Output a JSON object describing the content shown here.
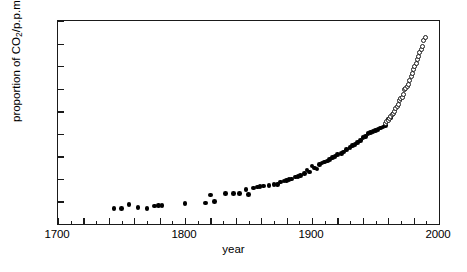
{
  "chart_data": {
    "type": "scatter",
    "title": "",
    "xlabel": "year",
    "ylabel": "proportion of CO2/p.p.m.",
    "ylabel_html": "proportion of CO<sub>2</sub>/p.p.m.",
    "xlim": [
      1700,
      2000
    ],
    "ylim": [
      270,
      360
    ],
    "xticks": [
      1700,
      1800,
      1900,
      2000
    ],
    "xtick_labels": [
      "1700",
      "1800",
      "1900",
      "2000"
    ],
    "xticks_minor_step": 10,
    "yticks": [
      270,
      280,
      290,
      300,
      310,
      320,
      330,
      340,
      350,
      360
    ],
    "ytick_labels": [
      "270",
      "280",
      "290",
      "300",
      "310",
      "320",
      "330",
      "340",
      "350",
      "360"
    ],
    "grid": false,
    "legend": "none",
    "series": [
      {
        "name": "ice-core measurements",
        "marker": "filled-circle",
        "color": "#000000",
        "points": [
          [
            1744,
            276.8
          ],
          [
            1750,
            277.0
          ],
          [
            1756,
            278.6
          ],
          [
            1763,
            277.3
          ],
          [
            1770,
            277.0
          ],
          [
            1776,
            278.0
          ],
          [
            1779,
            278.2
          ],
          [
            1782,
            278.3
          ],
          [
            1800,
            279.0
          ],
          [
            1816,
            279.4
          ],
          [
            1820,
            282.9
          ],
          [
            1823,
            280.0
          ],
          [
            1832,
            283.4
          ],
          [
            1838,
            283.6
          ],
          [
            1843,
            283.4
          ],
          [
            1848,
            285.3
          ],
          [
            1850,
            283.0
          ],
          [
            1854,
            286.0
          ],
          [
            1857,
            286.4
          ],
          [
            1859,
            286.6
          ],
          [
            1862,
            286.9
          ],
          [
            1866,
            287.0
          ],
          [
            1870,
            287.4
          ],
          [
            1873,
            287.6
          ],
          [
            1875,
            288.7
          ],
          [
            1878,
            289.0
          ],
          [
            1880,
            289.4
          ],
          [
            1882,
            289.6
          ],
          [
            1884,
            290.0
          ],
          [
            1887,
            290.8
          ],
          [
            1889,
            291.0
          ],
          [
            1891,
            291.4
          ],
          [
            1894,
            292.4
          ],
          [
            1896,
            294.0
          ],
          [
            1898,
            293.0
          ],
          [
            1900,
            295.8
          ],
          [
            1902,
            294.8
          ],
          [
            1904,
            294.4
          ],
          [
            1906,
            296.5
          ],
          [
            1908,
            297.0
          ],
          [
            1910,
            297.4
          ],
          [
            1912,
            298.0
          ],
          [
            1914,
            298.6
          ],
          [
            1916,
            299.4
          ],
          [
            1918,
            300.0
          ],
          [
            1920,
            300.7
          ],
          [
            1923,
            301.3
          ],
          [
            1925,
            302.0
          ],
          [
            1927,
            303.0
          ],
          [
            1930,
            304.0
          ],
          [
            1932,
            304.8
          ],
          [
            1934,
            305.3
          ],
          [
            1936,
            306.2
          ],
          [
            1938,
            307.0
          ],
          [
            1940,
            308.4
          ],
          [
            1942,
            308.8
          ],
          [
            1944,
            310.0
          ],
          [
            1946,
            310.5
          ],
          [
            1948,
            311.0
          ],
          [
            1950,
            311.4
          ],
          [
            1952,
            312.0
          ],
          [
            1954,
            312.6
          ],
          [
            1956,
            313.0
          ],
          [
            1958,
            313.8
          ],
          [
            1960,
            316.5
          ],
          [
            1962,
            317.0
          ]
        ]
      },
      {
        "name": "direct atmospheric measurements",
        "marker": "open-circle",
        "color": "#1a1a1a",
        "points": [
          [
            1958,
            314.6
          ],
          [
            1959,
            315.3
          ],
          [
            1960,
            316.0
          ],
          [
            1961,
            316.9
          ],
          [
            1962,
            317.6
          ],
          [
            1963,
            318.4
          ],
          [
            1964,
            319.0
          ],
          [
            1965,
            319.9
          ],
          [
            1966,
            321.2
          ],
          [
            1967,
            322.0
          ],
          [
            1968,
            322.9
          ],
          [
            1969,
            324.6
          ],
          [
            1970,
            325.6
          ],
          [
            1971,
            326.3
          ],
          [
            1972,
            327.4
          ],
          [
            1973,
            329.6
          ],
          [
            1974,
            330.2
          ],
          [
            1975,
            331.1
          ],
          [
            1976,
            332.0
          ],
          [
            1977,
            333.8
          ],
          [
            1978,
            335.4
          ],
          [
            1979,
            336.8
          ],
          [
            1980,
            338.7
          ],
          [
            1981,
            339.9
          ],
          [
            1982,
            341.1
          ],
          [
            1983,
            342.8
          ],
          [
            1984,
            344.4
          ],
          [
            1985,
            345.9
          ],
          [
            1986,
            347.2
          ],
          [
            1987,
            348.9
          ],
          [
            1988,
            351.5
          ],
          [
            1989,
            352.6
          ]
        ]
      }
    ]
  }
}
